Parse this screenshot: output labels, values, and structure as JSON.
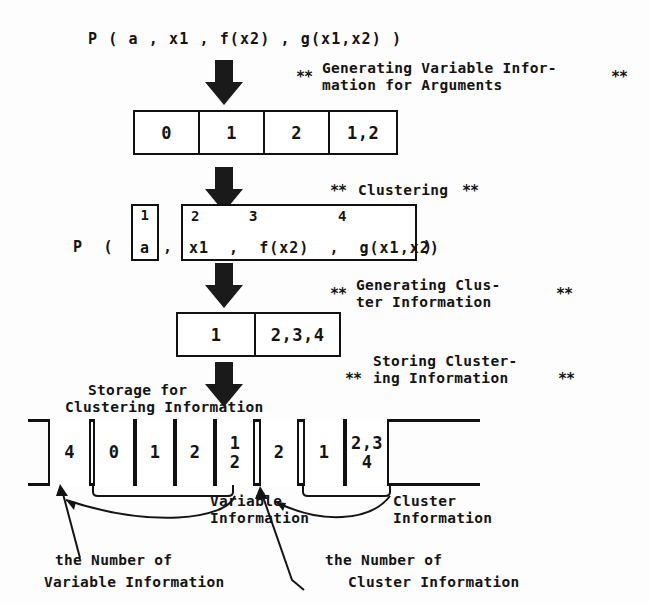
{
  "figure": {
    "type": "process-flow-diagram",
    "topic": "Generating and storing variable / cluster information for a predicate's arguments"
  },
  "predicate_top": "P ( a , x1 , f(x2) , g(x1,x2) )",
  "steps": [
    {
      "id": "generating-variable-information",
      "stars_left": "**",
      "stars_right": "**",
      "line1": "Generating Variable Infor-",
      "line2": "mation for Arguments"
    },
    {
      "id": "clustering",
      "stars_left": "**",
      "stars_right": "**",
      "line1": "Clustering",
      "line2": ""
    },
    {
      "id": "generating-cluster-information",
      "stars_left": "**",
      "stars_right": "**",
      "line1": "Generating Clus-",
      "line2": "ter Information"
    },
    {
      "id": "storing-clustering-information",
      "stars_left": "**",
      "stars_right": "**",
      "line1": "Storing Cluster-",
      "line2": "ing Information"
    }
  ],
  "variable_info_table": {
    "cells": [
      "0",
      "1",
      "2",
      "1,2"
    ]
  },
  "clustered_predicate": {
    "prefix": "P  (",
    "group_a": {
      "index": "1",
      "body": "a"
    },
    "separator": ",",
    "group_rest": {
      "indices": [
        "2",
        "3",
        "4"
      ],
      "body": "x1  ,  f(x2)  ,  g(x1,x2)"
    },
    "suffix": ")"
  },
  "cluster_info_table": {
    "cells": [
      "1",
      "2,3,4"
    ]
  },
  "storage": {
    "title_line1": "Storage for",
    "title_line2": "Clustering Information",
    "cells": [
      "4",
      "0",
      "1",
      "2",
      "1\n2",
      "2",
      "1",
      "2,3\n4"
    ]
  },
  "labels": {
    "variable_information_l1": "Variable",
    "variable_information_l2": "Information",
    "cluster_information_l1": "Cluster",
    "cluster_information_l2": "Information",
    "num_variable_info_l1": "the Number of",
    "num_variable_info_l2": "Variable Information",
    "num_cluster_info_l1": "the Number of",
    "num_cluster_info_l2": "Cluster Information"
  },
  "colors": {
    "ink": "#141414",
    "paper": "#fdfdfd",
    "arrow": "#1a1a1a"
  }
}
